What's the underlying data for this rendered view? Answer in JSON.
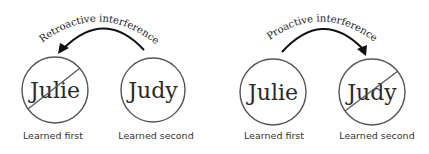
{
  "diagrams": [
    {
      "id": "retroactive",
      "arc_label": "Retroactive interference",
      "arrow_direction": "from second to first",
      "items": [
        {
          "name": "Julie",
          "caption": "Learned first",
          "crossed_out": true
        },
        {
          "name": "Judy",
          "caption": "Learned second",
          "crossed_out": false
        }
      ]
    },
    {
      "id": "proactive",
      "arc_label": "Proactive interference",
      "arrow_direction": "from first to second",
      "items": [
        {
          "name": "Julie",
          "caption": "Learned first",
          "crossed_out": false
        },
        {
          "name": "Judy",
          "caption": "Learned second",
          "crossed_out": true
        }
      ]
    }
  ],
  "colors": {
    "circle_stroke": "#555555",
    "arrow": "#111111",
    "text": "#2a2a2a",
    "background": "#ffffff"
  }
}
